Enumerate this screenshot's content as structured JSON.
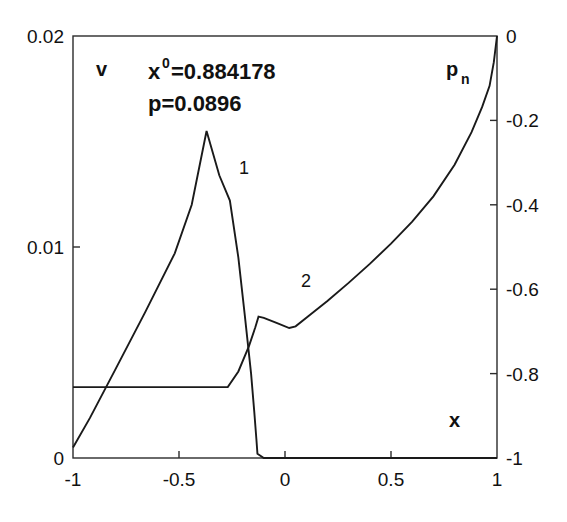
{
  "figure": {
    "background": "#ffffff",
    "line_color": "#1a1a1a",
    "axis_color": "#2b2b2b"
  },
  "annotations": {
    "x0_base": "x",
    "x0_sup": "0",
    "x0_value": "=0.884178",
    "p_line": "p=0.0896",
    "curve1_label": "1",
    "curve2_label": "2",
    "left_axis_name": "v",
    "right_axis_name_base": "p",
    "right_axis_name_sub": "n",
    "bottom_axis_name": "x"
  },
  "axes": {
    "x": {
      "label": "x",
      "min": -1,
      "max": 1,
      "ticks": [
        -1,
        -0.5,
        0,
        0.5,
        1
      ],
      "ticklabels": [
        "-1",
        "-0.5",
        "0",
        "0.5",
        "1"
      ]
    },
    "yleft": {
      "label": "v",
      "min": 0,
      "max": 0.02,
      "ticks": [
        0,
        0.01,
        0.02
      ],
      "ticklabels": [
        "0",
        "0.01",
        "0.02"
      ]
    },
    "yright": {
      "label": "p_n",
      "min": -1,
      "max": 0,
      "ticks": [
        -1,
        -0.8,
        -0.6,
        -0.4,
        -0.2,
        0
      ],
      "ticklabels": [
        "-1",
        "-0.8",
        "-0.6",
        "-0.4",
        "-0.2",
        "0"
      ]
    }
  },
  "chart_data": {
    "type": "line",
    "title": "",
    "xlabel": "x",
    "ylabel": "v",
    "ylabel_right": "p_n",
    "xlim": [
      -1,
      1
    ],
    "ylim": [
      0,
      0.02
    ],
    "ylim_right": [
      -1,
      0
    ],
    "grid": false,
    "legend": "inline-curve-numbers",
    "annotations": [
      "x0=0.884178",
      "p=0.0896"
    ],
    "series": [
      {
        "name": "1",
        "axis": "left",
        "description": "v profile: rises from near zero at x=-1 to a peak ~0.0155 near x=-0.37, then falls and drops to 0 at x=-0.13, staying at 0 to x=1",
        "x": [
          -1.0,
          -0.92,
          -0.8,
          -0.66,
          -0.52,
          -0.44,
          -0.37,
          -0.31,
          -0.26,
          -0.22,
          -0.19,
          -0.16,
          -0.145,
          -0.135,
          -0.13,
          -0.1,
          0.0,
          0.25,
          0.5,
          0.75,
          1.0
        ],
        "y": [
          0.0005,
          0.0019,
          0.0042,
          0.0069,
          0.0097,
          0.012,
          0.0155,
          0.0134,
          0.0122,
          0.0095,
          0.0068,
          0.004,
          0.0022,
          0.0009,
          0.0002,
          0.0,
          0.0,
          0.0,
          0.0,
          0.0,
          0.0
        ]
      },
      {
        "name": "2",
        "axis": "right",
        "description": "p_n profile: flat at about -0.83 from x=-1 to x=-0.27, rises steeply to about -0.66 near x=-0.13, small local dip to -0.69 near x=0.04, then rises smoothly to 0 at x=1",
        "x": [
          -1.0,
          -0.8,
          -0.6,
          -0.4,
          -0.3,
          -0.27,
          -0.22,
          -0.17,
          -0.14,
          -0.125,
          -0.1,
          -0.04,
          0.02,
          0.05,
          0.12,
          0.2,
          0.3,
          0.4,
          0.5,
          0.6,
          0.7,
          0.8,
          0.88,
          0.93,
          0.965,
          0.985,
          1.0
        ],
        "y": [
          -0.832,
          -0.832,
          -0.832,
          -0.832,
          -0.832,
          -0.832,
          -0.795,
          -0.735,
          -0.69,
          -0.665,
          -0.668,
          -0.68,
          -0.692,
          -0.688,
          -0.66,
          -0.628,
          -0.585,
          -0.54,
          -0.492,
          -0.44,
          -0.38,
          -0.305,
          -0.228,
          -0.168,
          -0.118,
          -0.062,
          0.0
        ]
      }
    ]
  }
}
